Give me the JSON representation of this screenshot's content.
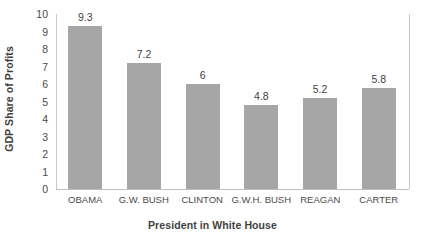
{
  "chart_data": {
    "type": "bar",
    "title": "",
    "subtitle": "",
    "xlabel": "President in White House",
    "ylabel": "GDP Share of Profits",
    "categories": [
      "OBAMA",
      "G.W. BUSH",
      "CLINTON",
      "G.W.H. BUSH",
      "REAGAN",
      "CARTER"
    ],
    "values": [
      9.3,
      7.2,
      6,
      4.8,
      5.2,
      5.8
    ],
    "value_labels": [
      "9.3",
      "7.2",
      "6",
      "4.8",
      "5.2",
      "5.8"
    ],
    "ylim": [
      0,
      10
    ],
    "ytick_step": 1,
    "ytick_labels": [
      "10",
      "9",
      "8",
      "7",
      "6",
      "5",
      "4",
      "3",
      "2",
      "1",
      "0"
    ],
    "grid": false,
    "legend": false,
    "legend_position": "none",
    "bar_color": "#a6a6a6",
    "axis_color": "#bfbfbf",
    "text_color": "#404040",
    "background_color": "#ffffff"
  }
}
